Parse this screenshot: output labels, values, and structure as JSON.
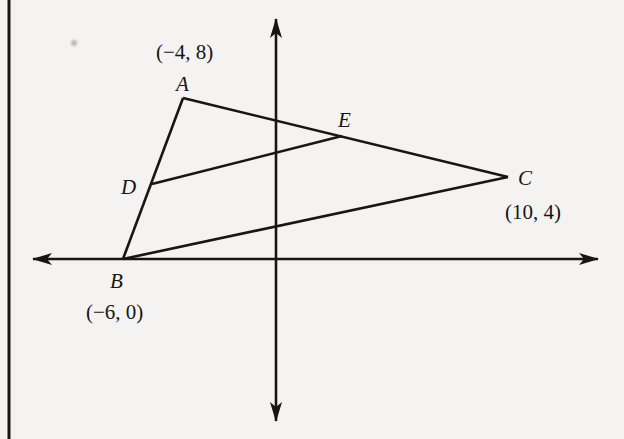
{
  "figure": {
    "type": "coordinate-geometry-diagram",
    "colors": {
      "background": "#f4f3f1",
      "ink": "#161616"
    }
  },
  "points": {
    "A": {
      "label": "A",
      "coord_label": "(−4, 8)",
      "x": -4,
      "y": 8
    },
    "B": {
      "label": "B",
      "coord_label": "(−6, 0)",
      "x": -6,
      "y": 0
    },
    "C": {
      "label": "C",
      "coord_label": "(10, 4)",
      "x": 10,
      "y": 4
    },
    "D": {
      "label": "D",
      "on_segment": "AB"
    },
    "E": {
      "label": "E",
      "on_segment": "AC"
    }
  },
  "segments": [
    {
      "from": "A",
      "to": "B"
    },
    {
      "from": "A",
      "to": "C"
    },
    {
      "from": "B",
      "to": "C"
    },
    {
      "from": "D",
      "to": "E"
    }
  ],
  "axes": {
    "x_axis": {
      "bidirectional_arrows": true
    },
    "y_axis": {
      "bidirectional_arrows": true
    }
  }
}
